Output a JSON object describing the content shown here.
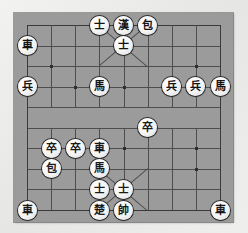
{
  "app": {
    "title": "Xiangqi Board",
    "board_label": "xiangqi-board"
  },
  "board": {
    "columns": 9,
    "rows": 10,
    "background_color": "#9b9b9b",
    "line_color": "#4e4e4e",
    "page_background": "#ececeb",
    "piece_fill": "#f4f4f4",
    "piece_outline": "#2a2a2a",
    "river_present": true,
    "top_palace_label": "black-palace",
    "bottom_palace_label": "red-palace"
  },
  "pieces": [
    {
      "id": "p01",
      "glyph": "士",
      "name": "advisor",
      "side": "black",
      "file": 3,
      "rank": 0
    },
    {
      "id": "p02",
      "glyph": "漢",
      "name": "general",
      "side": "black",
      "file": 4,
      "rank": 0
    },
    {
      "id": "p03",
      "glyph": "包",
      "name": "cannon",
      "side": "black",
      "file": 5,
      "rank": 0
    },
    {
      "id": "p04",
      "glyph": "士",
      "name": "advisor",
      "side": "black",
      "file": 4,
      "rank": 1
    },
    {
      "id": "p05",
      "glyph": "車",
      "name": "chariot",
      "side": "black",
      "file": 0,
      "rank": 1
    },
    {
      "id": "p06",
      "glyph": "兵",
      "name": "soldier",
      "side": "black",
      "file": 0,
      "rank": 3
    },
    {
      "id": "p07",
      "glyph": "馬",
      "name": "horse",
      "side": "black",
      "file": 3,
      "rank": 3
    },
    {
      "id": "p08",
      "glyph": "兵",
      "name": "soldier",
      "side": "black",
      "file": 6,
      "rank": 3
    },
    {
      "id": "p09",
      "glyph": "兵",
      "name": "soldier",
      "side": "black",
      "file": 7,
      "rank": 3
    },
    {
      "id": "p10",
      "glyph": "馬",
      "name": "horse",
      "side": "black",
      "file": 8,
      "rank": 3
    },
    {
      "id": "p11",
      "glyph": "卒",
      "name": "soldier",
      "side": "red",
      "file": 5,
      "rank": 5
    },
    {
      "id": "p12",
      "glyph": "卒",
      "name": "soldier",
      "side": "red",
      "file": 1,
      "rank": 6
    },
    {
      "id": "p13",
      "glyph": "卒",
      "name": "soldier",
      "side": "red",
      "file": 2,
      "rank": 6
    },
    {
      "id": "p14",
      "glyph": "車",
      "name": "chariot",
      "side": "red",
      "file": 3,
      "rank": 6
    },
    {
      "id": "p15",
      "glyph": "包",
      "name": "cannon",
      "side": "red",
      "file": 1,
      "rank": 7
    },
    {
      "id": "p16",
      "glyph": "馬",
      "name": "horse",
      "side": "red",
      "file": 3,
      "rank": 7
    },
    {
      "id": "p17",
      "glyph": "士",
      "name": "advisor",
      "side": "red",
      "file": 3,
      "rank": 8
    },
    {
      "id": "p18",
      "glyph": "士",
      "name": "advisor",
      "side": "red",
      "file": 4,
      "rank": 8
    },
    {
      "id": "p19",
      "glyph": "楚",
      "name": "general",
      "side": "red",
      "file": 3,
      "rank": 9
    },
    {
      "id": "p20",
      "glyph": "帥",
      "name": "marshal",
      "side": "red",
      "file": 4,
      "rank": 9
    },
    {
      "id": "p21",
      "glyph": "車",
      "name": "chariot",
      "side": "red",
      "file": 0,
      "rank": 9
    },
    {
      "id": "p22",
      "glyph": "車",
      "name": "chariot",
      "side": "red",
      "file": 8,
      "rank": 9
    }
  ],
  "star_points": [
    {
      "file": 1,
      "rank": 2
    },
    {
      "file": 7,
      "rank": 2
    },
    {
      "file": 2,
      "rank": 3
    },
    {
      "file": 4,
      "rank": 3
    },
    {
      "file": 1,
      "rank": 6
    },
    {
      "file": 4,
      "rank": 6
    },
    {
      "file": 7,
      "rank": 6
    },
    {
      "file": 7,
      "rank": 7
    }
  ]
}
